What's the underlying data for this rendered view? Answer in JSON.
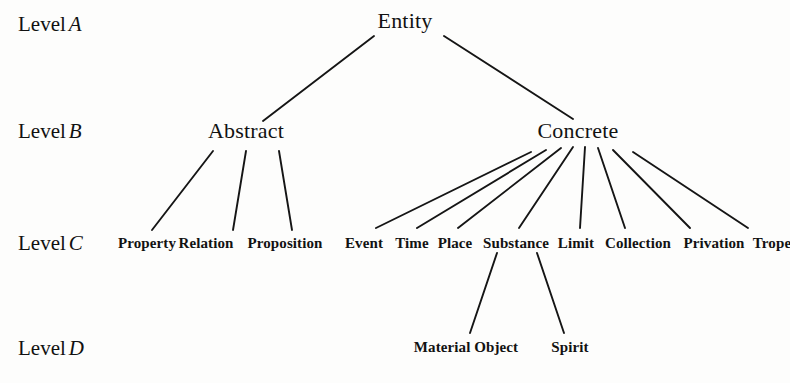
{
  "diagram": {
    "background_color": "#fdfdfc",
    "line_color": "#151515",
    "text_color": "#121212",
    "level_labels": [
      {
        "prefix": "Level",
        "letter": "A",
        "x": 18,
        "y": 14
      },
      {
        "prefix": "Level",
        "letter": "B",
        "x": 18,
        "y": 121
      },
      {
        "prefix": "Level",
        "letter": "C",
        "x": 18,
        "y": 233
      },
      {
        "prefix": "Level",
        "letter": "D",
        "x": 18,
        "y": 338
      }
    ],
    "nodes": {
      "level_a": [
        {
          "id": "entity",
          "label": "Entity",
          "cx": 405,
          "y": 10
        }
      ],
      "level_b": [
        {
          "id": "abstract",
          "label": "Abstract",
          "cx": 246,
          "y": 120
        },
        {
          "id": "concrete",
          "label": "Concrete",
          "cx": 578,
          "y": 120
        }
      ],
      "level_c": [
        {
          "id": "property",
          "label": "Property",
          "cx": 147,
          "y": 236
        },
        {
          "id": "relation",
          "label": "Relation",
          "cx": 206,
          "y": 236
        },
        {
          "id": "proposition",
          "label": "Proposition",
          "cx": 285,
          "y": 236
        },
        {
          "id": "event",
          "label": "Event",
          "cx": 364,
          "y": 236
        },
        {
          "id": "time",
          "label": "Time",
          "cx": 412,
          "y": 236
        },
        {
          "id": "place",
          "label": "Place",
          "cx": 455,
          "y": 236
        },
        {
          "id": "substance",
          "label": "Substance",
          "cx": 516,
          "y": 236
        },
        {
          "id": "limit",
          "label": "Limit",
          "cx": 576,
          "y": 236
        },
        {
          "id": "collection",
          "label": "Collection",
          "cx": 638,
          "y": 236
        },
        {
          "id": "privation",
          "label": "Privation",
          "cx": 714,
          "y": 236
        },
        {
          "id": "trope",
          "label": "Trope",
          "cx": 772,
          "y": 236
        }
      ],
      "level_d": [
        {
          "id": "material-object",
          "label": "Material Object",
          "cx": 466,
          "y": 340
        },
        {
          "id": "spirit",
          "label": "Spirit",
          "cx": 570,
          "y": 340
        }
      ]
    },
    "edges": [
      {
        "from": "entity",
        "to": "abstract",
        "x1": 374,
        "y1": 36,
        "x2": 263,
        "y2": 121
      },
      {
        "from": "entity",
        "to": "concrete",
        "x1": 444,
        "y1": 36,
        "x2": 573,
        "y2": 119
      },
      {
        "from": "abstract",
        "to": "property",
        "x1": 213,
        "y1": 151,
        "x2": 152,
        "y2": 230
      },
      {
        "from": "abstract",
        "to": "relation",
        "x1": 246,
        "y1": 151,
        "x2": 233,
        "y2": 230
      },
      {
        "from": "abstract",
        "to": "proposition",
        "x1": 279,
        "y1": 151,
        "x2": 292,
        "y2": 230
      },
      {
        "from": "concrete",
        "to": "event",
        "x1": 531,
        "y1": 152,
        "x2": 376,
        "y2": 228
      },
      {
        "from": "concrete",
        "to": "time",
        "x1": 546,
        "y1": 150,
        "x2": 417,
        "y2": 228
      },
      {
        "from": "concrete",
        "to": "place",
        "x1": 561,
        "y1": 148,
        "x2": 458,
        "y2": 228
      },
      {
        "from": "concrete",
        "to": "substance",
        "x1": 573,
        "y1": 147,
        "x2": 519,
        "y2": 228
      },
      {
        "from": "concrete",
        "to": "limit",
        "x1": 585,
        "y1": 147,
        "x2": 580,
        "y2": 228
      },
      {
        "from": "concrete",
        "to": "collection",
        "x1": 598,
        "y1": 148,
        "x2": 625,
        "y2": 228
      },
      {
        "from": "concrete",
        "to": "privation",
        "x1": 613,
        "y1": 150,
        "x2": 690,
        "y2": 228
      },
      {
        "from": "concrete",
        "to": "trope",
        "x1": 633,
        "y1": 152,
        "x2": 748,
        "y2": 228
      },
      {
        "from": "substance",
        "to": "material-object",
        "x1": 497,
        "y1": 253,
        "x2": 470,
        "y2": 333
      },
      {
        "from": "substance",
        "to": "spirit",
        "x1": 537,
        "y1": 253,
        "x2": 564,
        "y2": 333
      }
    ]
  }
}
